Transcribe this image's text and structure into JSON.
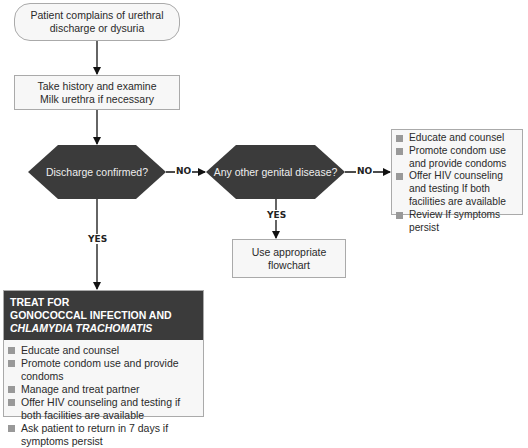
{
  "start": {
    "line1": "Patient complains of urethral",
    "line2": "discharge or dysuria"
  },
  "step2": {
    "line1": "Take history and examine",
    "line2": "Milk urethra if necessary"
  },
  "decision1": {
    "label": "Discharge confirmed?"
  },
  "decision2": {
    "label": "Any other genital disease?"
  },
  "edges": {
    "d1_no": "NO",
    "d1_yes": "YES",
    "d2_no": "NO",
    "d2_yes": "YES"
  },
  "flowchart_box": {
    "label": "Use appropriate flowchart"
  },
  "no_disease_box": {
    "items": [
      "Educate and counsel",
      "Promote condom use and provide condoms",
      "Offer HIV counseling and testing If both facilities are available",
      "Review If symptoms persist"
    ]
  },
  "treat_box": {
    "title_line1": "TREAT FOR",
    "title_line2": "GONOCOCCAL INFECTION AND",
    "title_line3": "CHLAMYDIA TRACHOMATIS",
    "items": [
      "Educate and counsel",
      "Promote condom use and provide condoms",
      "Manage and treat partner",
      "Offer HIV counseling and testing if both facilities are available",
      "Ask patient to return in 7 days if symptoms persist"
    ]
  },
  "colors": {
    "decision_fill": "#3b3b3b",
    "box_fill": "#f7f7f7",
    "box_border": "#aaaaaa",
    "bullet": "#999999"
  }
}
